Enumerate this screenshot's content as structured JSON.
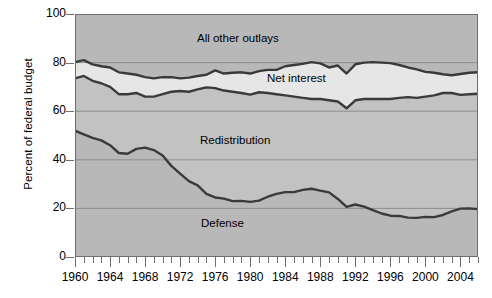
{
  "chart_data": {
    "type": "area",
    "title": "",
    "xlabel": "",
    "ylabel": "Percent of federal budget",
    "ylim": [
      0,
      100
    ],
    "xlim": [
      1960,
      2006
    ],
    "yticks": [
      0,
      20,
      40,
      60,
      80,
      100
    ],
    "xticks_labeled": [
      1960,
      1964,
      1968,
      1972,
      1976,
      1980,
      1984,
      1988,
      1992,
      1996,
      2000,
      2004
    ],
    "xtick_interval_minor": 1,
    "grid": "horizontal",
    "legend_position": "inline-band-labels",
    "stacking": "cumulative-from-bottom",
    "band_labels": {
      "defense": "Defense",
      "redistribution": "Redistribution",
      "net_interest": "Net interest",
      "all_other": "All other outlays"
    },
    "colors": {
      "plot_background": "#b8b8b8",
      "band_defense": "#b8b8b8",
      "band_redistribution": "#c2c2c2",
      "band_net_interest": "#e6e6e6",
      "band_all_other": "#b8b8b8",
      "curve": "#3a3a3a",
      "gridline": "#8d8d8d",
      "frame": "#6e6e6e",
      "text": "#000000"
    },
    "x": [
      1960,
      1961,
      1962,
      1963,
      1964,
      1965,
      1966,
      1967,
      1968,
      1969,
      1970,
      1971,
      1972,
      1973,
      1974,
      1975,
      1976,
      1977,
      1978,
      1979,
      1980,
      1981,
      1982,
      1983,
      1984,
      1985,
      1986,
      1987,
      1988,
      1989,
      1990,
      1991,
      1992,
      1993,
      1994,
      1995,
      1996,
      1997,
      1998,
      1999,
      2000,
      2001,
      2002,
      2003,
      2004,
      2005,
      2006
    ],
    "series": [
      {
        "name": "Defense",
        "kind": "cumulative_boundary",
        "values": [
          52.0,
          50.5,
          49.0,
          48.0,
          46.0,
          42.8,
          42.5,
          44.5,
          45.0,
          44.0,
          41.8,
          37.5,
          34.3,
          31.2,
          29.5,
          26.0,
          24.5,
          24.0,
          23.0,
          23.1,
          22.7,
          23.2,
          24.8,
          26.0,
          26.7,
          26.7,
          27.6,
          28.1,
          27.3,
          26.6,
          23.9,
          20.6,
          21.6,
          20.7,
          19.3,
          17.9,
          17.0,
          16.9,
          16.2,
          16.1,
          16.5,
          16.4,
          17.3,
          18.8,
          19.9,
          20.0,
          19.7
        ]
      },
      {
        "name": "Redistribution",
        "kind": "cumulative_boundary",
        "values": [
          73.5,
          74.5,
          72.5,
          71.5,
          70.0,
          67.0,
          67.0,
          67.5,
          66.0,
          66.0,
          67.0,
          68.0,
          68.3,
          68.0,
          69.0,
          69.8,
          69.5,
          68.5,
          68.0,
          67.5,
          66.8,
          67.8,
          67.5,
          67.0,
          66.5,
          66.0,
          65.5,
          65.0,
          65.0,
          64.5,
          64.0,
          61.2,
          64.5,
          65.0,
          65.0,
          65.0,
          65.0,
          65.5,
          65.8,
          65.5,
          66.0,
          66.5,
          67.5,
          67.5,
          66.7,
          67.0,
          67.2
        ]
      },
      {
        "name": "Net interest",
        "kind": "cumulative_boundary",
        "values": [
          80.2,
          81.0,
          79.3,
          78.5,
          78.0,
          76.0,
          75.5,
          75.0,
          74.0,
          73.5,
          74.0,
          74.0,
          73.5,
          73.8,
          74.5,
          75.0,
          76.8,
          75.5,
          75.8,
          76.0,
          75.5,
          76.5,
          77.0,
          77.0,
          78.5,
          79.0,
          79.5,
          80.2,
          79.7,
          78.0,
          78.8,
          75.5,
          79.3,
          80.0,
          80.2,
          80.0,
          79.8,
          79.0,
          78.0,
          77.2,
          76.2,
          75.8,
          75.2,
          74.8,
          75.3,
          75.8,
          76.0
        ]
      },
      {
        "name": "All other outlays",
        "kind": "cumulative_boundary",
        "values": [
          100,
          100,
          100,
          100,
          100,
          100,
          100,
          100,
          100,
          100,
          100,
          100,
          100,
          100,
          100,
          100,
          100,
          100,
          100,
          100,
          100,
          100,
          100,
          100,
          100,
          100,
          100,
          100,
          100,
          100,
          100,
          100,
          100,
          100,
          100,
          100,
          100,
          100,
          100,
          100,
          100,
          100,
          100,
          100,
          100,
          100,
          100
        ]
      }
    ]
  }
}
